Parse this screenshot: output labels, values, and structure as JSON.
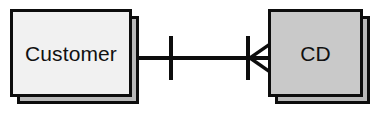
{
  "diagram": {
    "type": "entity-relationship-diagram",
    "notation": "crow's foot",
    "background_color": "#ffffff",
    "line_color": "#0d0d0d",
    "entities": [
      {
        "id": "customer",
        "label": "Customer",
        "fill_color": "#f1f1f1",
        "border_color": "#0d0d0d",
        "style": "stacked-card",
        "x": 10,
        "y": 9,
        "width": 122,
        "height": 88
      },
      {
        "id": "cd",
        "label": "CD",
        "fill_color": "#c9c9c9",
        "border_color": "#0d0d0d",
        "style": "stacked-card",
        "x": 268,
        "y": 9,
        "width": 95,
        "height": 88
      }
    ],
    "relationship": {
      "from": "customer",
      "to": "cd",
      "from_cardinality": "one",
      "to_cardinality": "many",
      "from_symbol": "single-bar",
      "to_symbol": "crows-foot",
      "line_y": 58
    }
  }
}
